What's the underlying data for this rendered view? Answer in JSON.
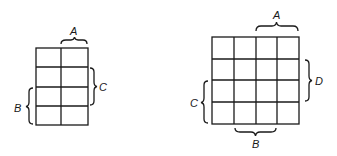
{
  "maps": [
    {
      "name": "three-variable-kmap",
      "rows": 4,
      "cols": 2,
      "labels": {
        "top": "A",
        "right": "C",
        "left": "B"
      }
    },
    {
      "name": "four-variable-kmap",
      "rows": 4,
      "cols": 4,
      "labels": {
        "top": "A",
        "right": "D",
        "left": "C",
        "bottom": "B"
      }
    }
  ],
  "colors": {
    "line": "#1a1a1a",
    "background": "#ffffff"
  }
}
